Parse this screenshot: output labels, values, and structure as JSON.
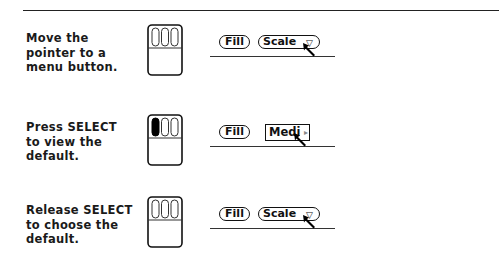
{
  "steps": [
    {
      "instruction": "Move the\npointer to a\nmenu button.",
      "mouse_state": "none-pressed",
      "buttons": {
        "fill": "Fill",
        "menu": "Scale",
        "menu_glyph": "▽"
      }
    },
    {
      "instruction": "Press SELECT\nto view the\ndefault.",
      "mouse_state": "select-pressed",
      "buttons": {
        "fill": "Fill",
        "menu": "Medi",
        "menu_glyph": "▸"
      }
    },
    {
      "instruction": "Release SELECT\nto choose the\ndefault.",
      "mouse_state": "none-pressed",
      "buttons": {
        "fill": "Fill",
        "menu": "Scale",
        "menu_glyph": "▽"
      }
    }
  ],
  "colors": {
    "ink": "#111111",
    "background": "#ffffff",
    "pressed": "#000000"
  }
}
